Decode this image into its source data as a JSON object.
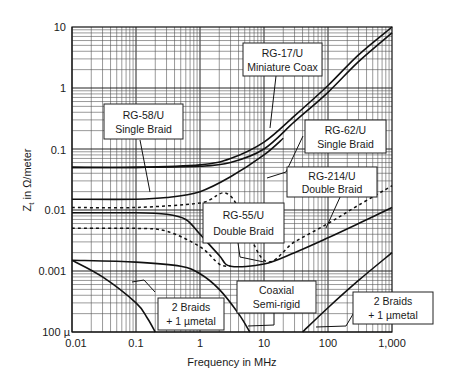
{
  "chart_data": {
    "type": "line",
    "title": "",
    "xlabel": "Frequency in MHz",
    "ylabel": "Z_t in Ω/meter",
    "xscale": "log",
    "yscale": "log",
    "xlim": [
      0.01,
      1000
    ],
    "ylim": [
      0.0001,
      10
    ],
    "x_ticks": [
      "0.01",
      "0.1",
      "1",
      "10",
      "100",
      "1,000"
    ],
    "y_ticks": [
      "100 µ",
      "0.001",
      "0.01",
      "0.1",
      "1",
      "10"
    ],
    "grid": true,
    "legend": "callout boxes",
    "series": [
      {
        "name": "RG-17/U Miniature Coax",
        "style": "solid",
        "x": [
          0.01,
          0.1,
          1,
          3,
          10,
          30,
          100,
          300,
          1000
        ],
        "y": [
          0.05,
          0.05,
          0.055,
          0.07,
          0.13,
          0.35,
          1.1,
          3.5,
          10
        ]
      },
      {
        "name": "RG-62/U Single Braid",
        "style": "solid",
        "x": [
          0.01,
          0.1,
          1,
          3,
          10,
          30,
          100,
          300,
          1000
        ],
        "y": [
          0.05,
          0.05,
          0.052,
          0.06,
          0.1,
          0.28,
          0.85,
          2.7,
          8
        ]
      },
      {
        "name": "RG-58/U Single Braid",
        "style": "solid",
        "x": [
          0.01,
          0.1,
          0.3,
          1,
          3,
          10,
          20
        ],
        "y": [
          0.015,
          0.015,
          0.016,
          0.02,
          0.035,
          0.08,
          0.15
        ]
      },
      {
        "name": "RG-214/U Double Braid",
        "style": "dashed",
        "x": [
          0.01,
          0.1,
          1,
          3,
          10,
          30,
          100,
          300,
          1000
        ],
        "y": [
          0.011,
          0.011,
          0.013,
          0.017,
          0.0015,
          0.003,
          0.006,
          0.012,
          0.025
        ]
      },
      {
        "name": "RG-55/U Double Braid",
        "style": "solid",
        "x": [
          0.01,
          0.1,
          0.3,
          0.6,
          1,
          2,
          3,
          10,
          30,
          100,
          300,
          1000
        ],
        "y": [
          0.009,
          0.009,
          0.0085,
          0.007,
          0.004,
          0.0018,
          0.0012,
          0.0013,
          0.002,
          0.0035,
          0.006,
          0.011
        ]
      },
      {
        "name": "RG-55/U (lower dashed)",
        "style": "dashed",
        "x": [
          0.01,
          0.1,
          0.3,
          1,
          2,
          3
        ],
        "y": [
          0.005,
          0.005,
          0.0045,
          0.0025,
          0.0013,
          0.0012
        ]
      },
      {
        "name": "Coaxial Semi-rigid",
        "style": "solid",
        "x": [
          0.01,
          0.1,
          0.5,
          1,
          2,
          4,
          6
        ],
        "y": [
          0.0015,
          0.0014,
          0.0012,
          0.0009,
          0.0005,
          0.0002,
          0.0001
        ]
      },
      {
        "name": "2 Braids + 1 µmetal (low freq)",
        "style": "solid",
        "x": [
          0.01,
          0.03,
          0.1,
          0.15,
          0.2
        ],
        "y": [
          0.0015,
          0.0008,
          0.0003,
          0.00017,
          0.0001
        ]
      },
      {
        "name": "2 Braids + 1 µmetal (high freq)",
        "style": "solid",
        "x": [
          40,
          100,
          300,
          1000
        ],
        "y": [
          0.0001,
          0.00025,
          0.0007,
          0.002
        ]
      }
    ],
    "annotations": [
      {
        "text": [
          "RG-17/U",
          "Miniature Coax"
        ]
      },
      {
        "text": [
          "RG-58/U",
          "Single Braid"
        ]
      },
      {
        "text": [
          "RG-62/U",
          "Single Braid"
        ]
      },
      {
        "text": [
          "RG-214/U",
          "Double Braid"
        ]
      },
      {
        "text": [
          "RG-55/U",
          "Double Braid"
        ]
      },
      {
        "text": [
          "Coaxial",
          "Semi-rigid"
        ]
      },
      {
        "text": [
          "2 Braids",
          "+ 1 µmetal"
        ]
      },
      {
        "text": [
          "2 Braids",
          "+ 1 µmetal"
        ]
      }
    ]
  },
  "axes": {
    "xlabel": "Frequency in MHz",
    "ylabel": "Z",
    "ylabel_sub": "t",
    "ylabel_rest": " in Ω/meter",
    "x_ticks": [
      "0.01",
      "0.1",
      "1",
      "10",
      "100",
      "1,000"
    ],
    "y_ticks": [
      "10",
      "1",
      "0.1",
      "0.01",
      "0.001",
      "100 µ"
    ]
  },
  "labels": {
    "rg17": [
      "RG-17/U",
      "Miniature Coax"
    ],
    "rg58": [
      "RG-58/U",
      "Single Braid"
    ],
    "rg62": [
      "RG-62/U",
      "Single Braid"
    ],
    "rg214": [
      "RG-214/U",
      "Double Braid"
    ],
    "rg55": [
      "RG-55/U",
      "Double Braid"
    ],
    "semirigid": [
      "Coaxial",
      "Semi-rigid"
    ],
    "braids_left": [
      "2 Braids",
      "+ 1 µmetal"
    ],
    "braids_right": [
      "2 Braids",
      "+ 1 µmetal"
    ]
  }
}
